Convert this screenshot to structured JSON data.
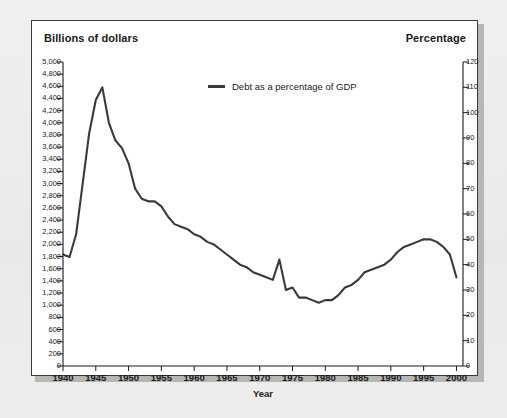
{
  "figure": {
    "left_axis_header": "Billions of dollars",
    "right_axis_header": "Percentage",
    "x_axis_title": "Year",
    "legend_label": "Debt as a percentage of GDP",
    "line_color": "#3a3a3a",
    "panel_background": "#ffffff",
    "page_background": "#ececeb",
    "frame_color": "#3a3a3a"
  },
  "chart_data": {
    "type": "line",
    "title": "",
    "subtitle": "",
    "xlabel": "Year",
    "ylabel": "Billions of dollars",
    "y2label": "Percentage",
    "grid": false,
    "legend_position": "top-center",
    "xlim": [
      1940,
      2001
    ],
    "ylim": [
      0,
      5000
    ],
    "y2lim": [
      0,
      120
    ],
    "x_ticks": [
      1940,
      1945,
      1950,
      1955,
      1960,
      1965,
      1970,
      1975,
      1980,
      1985,
      1990,
      1995,
      2000
    ],
    "x_tick_labels": [
      "1940",
      "1945",
      "1950",
      "1955",
      "1960",
      "1965",
      "1970",
      "1975",
      "1980",
      "1985",
      "1990",
      "1995",
      "2000"
    ],
    "y_ticks": [
      0,
      200,
      400,
      600,
      800,
      1000,
      1200,
      1400,
      1600,
      1800,
      2000,
      2200,
      2400,
      2600,
      2800,
      3000,
      3200,
      3400,
      3600,
      3800,
      4000,
      4200,
      4400,
      4600,
      4800,
      5000
    ],
    "y_tick_labels": [
      "0",
      "200",
      "400",
      "600",
      "800",
      "1,000",
      "1,200",
      "1,400",
      "1,600",
      "1,800",
      "2,000",
      "2,200",
      "2,400",
      "2,600",
      "2,800",
      "3,000",
      "3,200",
      "3,400",
      "3,600",
      "3,800",
      "4,000",
      "4,200",
      "4,400",
      "4,600",
      "4,800",
      "5,000"
    ],
    "y2_ticks": [
      0,
      10,
      20,
      30,
      40,
      50,
      60,
      70,
      80,
      90,
      100,
      110,
      120
    ],
    "y2_tick_labels": [
      "0",
      "10",
      "20",
      "30",
      "40",
      "50",
      "60",
      "70",
      "80",
      "90",
      "100",
      "110",
      "120"
    ],
    "series": [
      {
        "name": "Debt as a percentage of GDP",
        "color": "#3a3a3a",
        "x": [
          1940,
          1941,
          1942,
          1943,
          1944,
          1945,
          1946,
          1947,
          1948,
          1949,
          1950,
          1951,
          1952,
          1953,
          1954,
          1955,
          1956,
          1957,
          1958,
          1959,
          1960,
          1961,
          1962,
          1963,
          1964,
          1965,
          1966,
          1967,
          1968,
          1969,
          1970,
          1971,
          1972,
          1973,
          1974,
          1975,
          1976,
          1977,
          1978,
          1979,
          1980,
          1981,
          1982,
          1983,
          1984,
          1985,
          1986,
          1987,
          1988,
          1989,
          1990,
          1991,
          1992,
          1993,
          1994,
          1995,
          1996,
          1997,
          1998,
          1999,
          2000
        ],
        "values": [
          44,
          43,
          52,
          72,
          92,
          105,
          110,
          96,
          89,
          86,
          80,
          70,
          66,
          65,
          65,
          63,
          59,
          56,
          55,
          54,
          52,
          51,
          49,
          48,
          46,
          44,
          42,
          40,
          39,
          37,
          36,
          35,
          34,
          42,
          30,
          31,
          27,
          27,
          26,
          25,
          26,
          26,
          28,
          31,
          32,
          34,
          37,
          38,
          39,
          40,
          42,
          45,
          47,
          48,
          49,
          50,
          50,
          49,
          47,
          44,
          35
        ],
        "value_units": "percent of GDP",
        "axis": "right"
      }
    ]
  }
}
